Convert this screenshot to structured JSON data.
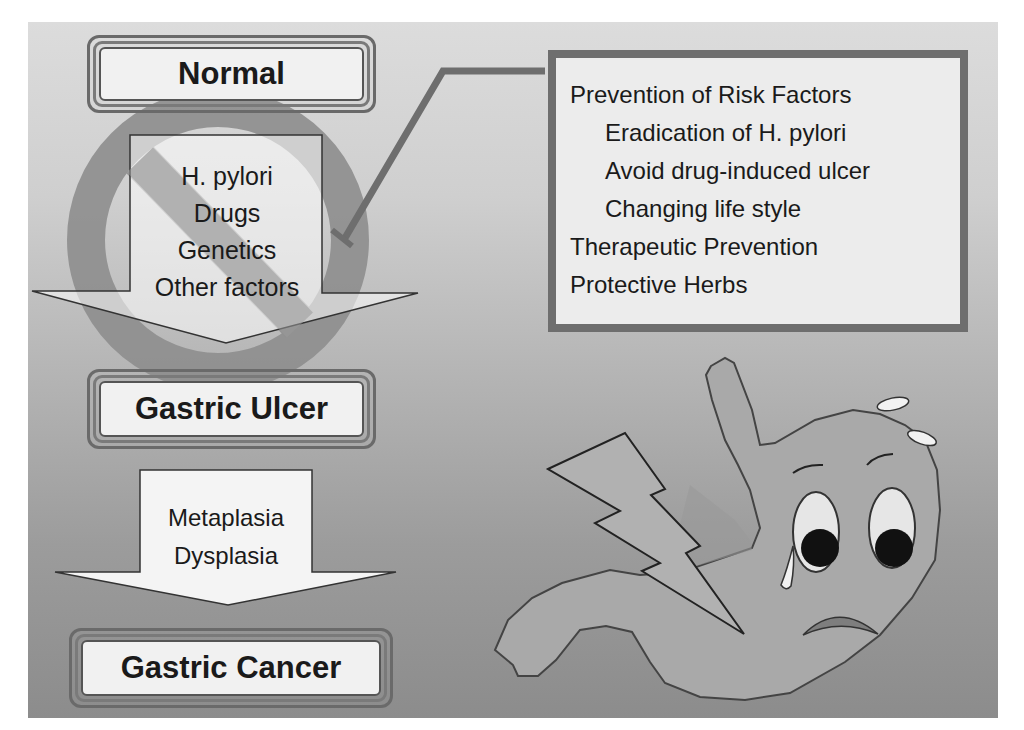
{
  "slide": {
    "background_top": "#dcdcdc",
    "background_bottom": "#8c8c8c"
  },
  "stages": [
    {
      "id": "normal",
      "label": "Normal"
    },
    {
      "id": "gastric-ulcer",
      "label": "Gastric Ulcer"
    },
    {
      "id": "gastric-cancer",
      "label": "Gastric Cancer"
    }
  ],
  "risk_arrow": {
    "lines": [
      "H. pylori",
      "Drugs",
      "Genetics",
      "Other factors"
    ]
  },
  "progression_arrow": {
    "lines": [
      "Metaplasia",
      "Dysplasia"
    ]
  },
  "prevention_box": {
    "items": [
      {
        "text": "Prevention of Risk Factors",
        "level": 0
      },
      {
        "text": "Eradication of H. pylori",
        "level": 1
      },
      {
        "text": "Avoid drug-induced ulcer",
        "level": 1
      },
      {
        "text": "Changing life style",
        "level": 1
      },
      {
        "text": "Therapeutic Prevention",
        "level": 0
      },
      {
        "text": "Protective Herbs",
        "level": 0
      }
    ]
  },
  "icons": {
    "prohibition": "no-entry-sign-icon",
    "lightning": "lightning-bolt-icon",
    "stomach": "sad-stomach-character-icon"
  },
  "colors": {
    "prohibition_sign": "#8e8e8e",
    "callout_line": "#6e6e6e",
    "stomach_fill": "#a9a9a9",
    "box_fill": "#f1f1f1"
  }
}
